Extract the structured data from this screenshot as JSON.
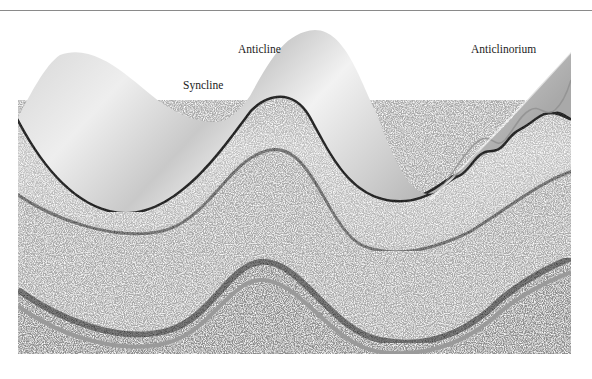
{
  "figure": {
    "labels": {
      "anticline": "Anticline",
      "syncline": "Syncline",
      "anticlinorium": "Anticlinorium"
    },
    "layers": [
      {
        "name": "top-surface-sheet",
        "color": "#e6e6e6"
      },
      {
        "name": "dark-bed",
        "color": "#3a3a3a"
      },
      {
        "name": "upper-stratum",
        "color": "#b9b9b9"
      },
      {
        "name": "speckled-band-1",
        "color": "#8f8f8f"
      },
      {
        "name": "middle-stratum",
        "color": "#a8a8a8"
      },
      {
        "name": "speckled-band-2",
        "color": "#8a8a8a"
      },
      {
        "name": "lower-stratum",
        "color": "#8c8c8c"
      }
    ]
  }
}
